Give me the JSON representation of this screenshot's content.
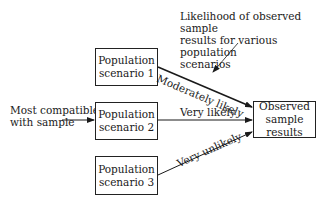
{
  "annotation": {
    "lines": [
      "Likelihood of observed sample",
      "results for various population",
      "scenarios"
    ]
  },
  "left_label": {
    "lines": [
      "Most compatible",
      "with sample"
    ]
  },
  "scenarios": [
    {
      "line1": "Population",
      "line2": "scenario 1",
      "edge_label": "Moderately likely"
    },
    {
      "line1": "Population",
      "line2": "scenario 2",
      "edge_label": "Very likely"
    },
    {
      "line1": "Population",
      "line2": "scenario 3",
      "edge_label": "Very unlikely"
    }
  ],
  "target": {
    "lines": [
      "Observed",
      "sample",
      "results"
    ]
  },
  "colors": {
    "line": "#1a1a1a",
    "background": "#ffffff"
  }
}
